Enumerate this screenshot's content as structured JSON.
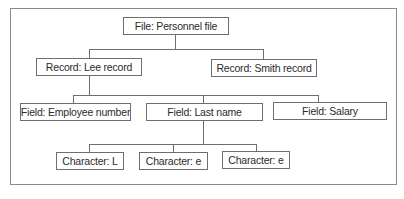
{
  "diagram": {
    "type": "hierarchy",
    "root": {
      "label": "File: Personnel file",
      "children": [
        {
          "label": "Record: Lee record",
          "children": [
            {
              "label": "Field: Employee number"
            },
            {
              "label": "Field: Last name",
              "children": [
                {
                  "label": "Character: L"
                },
                {
                  "label": "Character: e"
                },
                {
                  "label": "Character: e"
                }
              ]
            },
            {
              "label": "Field: Salary"
            }
          ]
        },
        {
          "label": "Record: Smith record"
        }
      ]
    }
  },
  "nodes": {
    "file": "File: Personnel file",
    "record_lee": "Record: Lee record",
    "record_smith": "Record: Smith record",
    "field_employee_number": "Field: Employee number",
    "field_last_name": "Field: Last name",
    "field_salary": "Field: Salary",
    "char_1": "Character: L",
    "char_2": "Character: e",
    "char_3": "Character: e"
  },
  "colors": {
    "line": "#6e6e6e",
    "frame": "#8a8a8a",
    "text": "#2b2b2b"
  }
}
